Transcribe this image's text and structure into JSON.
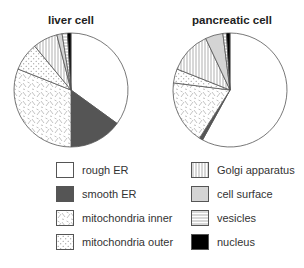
{
  "chart_data": [
    {
      "type": "pie",
      "title": "liver cell",
      "categories": [
        "rough ER",
        "smooth ER",
        "mitochondria inner",
        "mitochondria outer",
        "Golgi apparatus",
        "cell surface",
        "vesicles",
        "nucleus"
      ],
      "values": [
        35,
        15,
        31,
        8,
        7,
        1.5,
        1.5,
        1
      ],
      "unit": "% of total membrane (approx.)",
      "start_angle": "12 o'clock",
      "direction": "clockwise"
    },
    {
      "type": "pie",
      "title": "pancreatic cell",
      "categories": [
        "rough ER",
        "smooth ER",
        "mitochondria inner",
        "mitochondria outer",
        "Golgi apparatus",
        "cell surface",
        "vesicles",
        "nucleus"
      ],
      "values": [
        58,
        1,
        18,
        4,
        12,
        5,
        1,
        1
      ],
      "unit": "% of total membrane (approx.)",
      "start_angle": "12 o'clock",
      "direction": "clockwise"
    }
  ],
  "titles": {
    "liver": "liver cell",
    "pancreas": "pancreatic cell"
  },
  "legend": {
    "left": [
      {
        "label": "rough ER",
        "pattern": "white"
      },
      {
        "label": "smooth ER",
        "pattern": "dark-gray"
      },
      {
        "label": "mitochondria inner",
        "pattern": "dashes"
      },
      {
        "label": "mitochondria outer",
        "pattern": "dots"
      }
    ],
    "right": [
      {
        "label": "Golgi apparatus",
        "pattern": "vertical-lines"
      },
      {
        "label": "cell surface",
        "pattern": "light-gray"
      },
      {
        "label": "vesicles",
        "pattern": "horizontal-lines"
      },
      {
        "label": "nucleus",
        "pattern": "black"
      }
    ]
  },
  "colors": {
    "smooth_er": "#555555",
    "cell_surface": "#d4d4d4",
    "nucleus": "#000000",
    "outline": "#555555"
  }
}
